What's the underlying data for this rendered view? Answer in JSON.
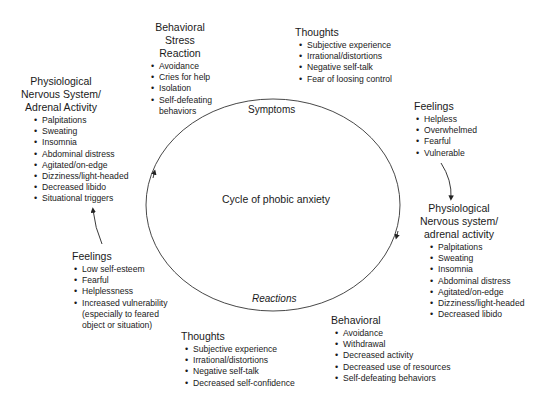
{
  "diagram": {
    "center_label": "Cycle of phobic anxiety",
    "arc_labels": {
      "top": "Symptoms",
      "bottom": "Reactions"
    },
    "blocks": [
      {
        "id": "behavioral-stress-reaction",
        "title_lines": [
          "Behavioral",
          "Stress Reaction"
        ],
        "items": [
          "Avoidance",
          "Cries for help",
          "Isolation",
          "Self-defeating",
          "behaviors"
        ]
      },
      {
        "id": "thoughts-top",
        "title_lines": [
          "Thoughts"
        ],
        "items": [
          "Subjective experience",
          "Irrational/distortions",
          "Negative self-talk",
          "Fear of loosing control"
        ]
      },
      {
        "id": "physiological-left",
        "title_lines": [
          "Physiological",
          "Nervous System/",
          "Adrenal Activity"
        ],
        "items": [
          "Palpitations",
          "Sweating",
          "Insomnia",
          "Abdominal distress",
          "Agitated/on-edge",
          "Dizziness/light-headed",
          "Decreased libido",
          "Situational triggers"
        ]
      },
      {
        "id": "feelings-right",
        "title_lines": [
          "Feelings"
        ],
        "items": [
          "Helpless",
          "Overwhelmed",
          "Fearful",
          "Vulnerable"
        ]
      },
      {
        "id": "physiological-right",
        "title_lines": [
          "Physiological",
          "Nervous system/",
          "adrenal activity"
        ],
        "items": [
          "Palpitations",
          "Sweating",
          "Insomnia",
          "Abdominal distress",
          "Agitated/on-edge",
          "Dizziness/light-headed",
          "Decreased libido"
        ]
      },
      {
        "id": "feelings-left",
        "title_lines": [
          "Feelings"
        ],
        "items": [
          "Low self-esteem",
          "Fearful",
          "Helplessness",
          "Increased vulnerability",
          "(especially to feared",
          "object or situation)"
        ]
      },
      {
        "id": "thoughts-bottom",
        "title_lines": [
          "Thoughts"
        ],
        "items": [
          "Subjective experience",
          "Irrational/distortions",
          "Negative self-talk",
          "Decreased self-confidence"
        ]
      },
      {
        "id": "behavioral-bottom",
        "title_lines": [
          "Behavioral"
        ],
        "items": [
          "Avoidance",
          "Withdrawal",
          "Decreased activity",
          "Decreased use of resources",
          "Self-defeating behaviors"
        ]
      }
    ]
  }
}
